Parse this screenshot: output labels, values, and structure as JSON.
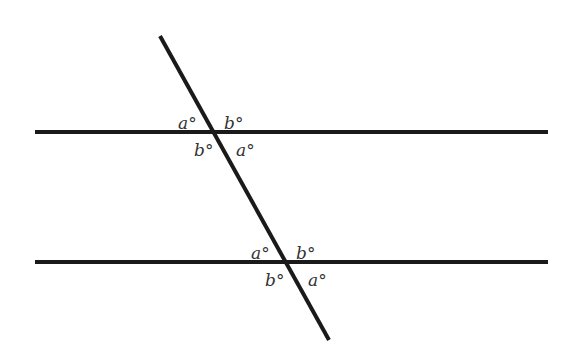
{
  "diagram": {
    "colors": {
      "line": "#1a1a1a",
      "label": "#333333",
      "background": "#ffffff"
    },
    "lines": [
      {
        "id": "parallel-top",
        "x1": 35,
        "y1": 132,
        "x2": 548,
        "y2": 132
      },
      {
        "id": "parallel-bottom",
        "x1": 35,
        "y1": 262,
        "x2": 548,
        "y2": 262
      },
      {
        "id": "transversal",
        "x1": 160,
        "y1": 36,
        "x2": 329,
        "y2": 340
      }
    ],
    "labels": {
      "top_intersection": {
        "upper_left": "a°",
        "upper_right": "b°",
        "lower_left": "b°",
        "lower_right": "a°"
      },
      "bottom_intersection": {
        "upper_left": "a°",
        "upper_right": "b°",
        "lower_left": "b°",
        "lower_right": "a°"
      }
    }
  }
}
